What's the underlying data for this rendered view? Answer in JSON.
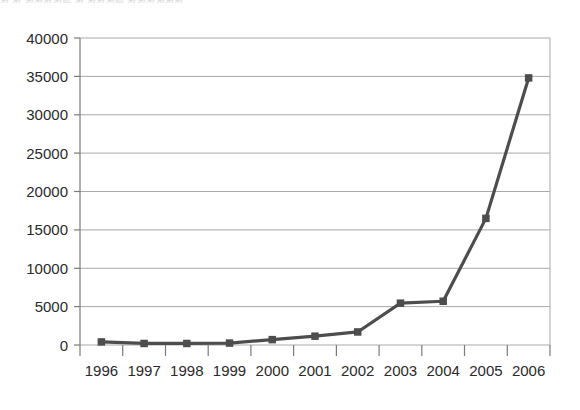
{
  "scan_residue_text": "第 第  第第第第题     第 第第第题     第第第第第第",
  "chart_data": {
    "type": "line",
    "title": "",
    "subtitle": "",
    "xlabel": "",
    "ylabel": "",
    "categories": [
      "1996",
      "1997",
      "1998",
      "1999",
      "2000",
      "2001",
      "2002",
      "2003",
      "2004",
      "2005",
      "2006"
    ],
    "series": [
      {
        "name": "series-1",
        "values": [
          400,
          200,
          200,
          250,
          700,
          1150,
          1700,
          5450,
          5700,
          16500,
          34800
        ]
      }
    ],
    "ylim": [
      0,
      40000
    ],
    "yticks": [
      0,
      5000,
      10000,
      15000,
      20000,
      25000,
      30000,
      35000,
      40000
    ],
    "ytick_labels": [
      "0",
      "5000",
      "10000",
      "15000",
      "20000",
      "25000",
      "30000",
      "35000",
      "40000"
    ],
    "grid": "horizontal",
    "legend": "none",
    "line_color": "#4d4d4d",
    "marker": "square",
    "marker_color": "#4d4d4d",
    "axis_color": "#808080",
    "grid_color": "#a9a9a9",
    "background": "#ffffff"
  }
}
